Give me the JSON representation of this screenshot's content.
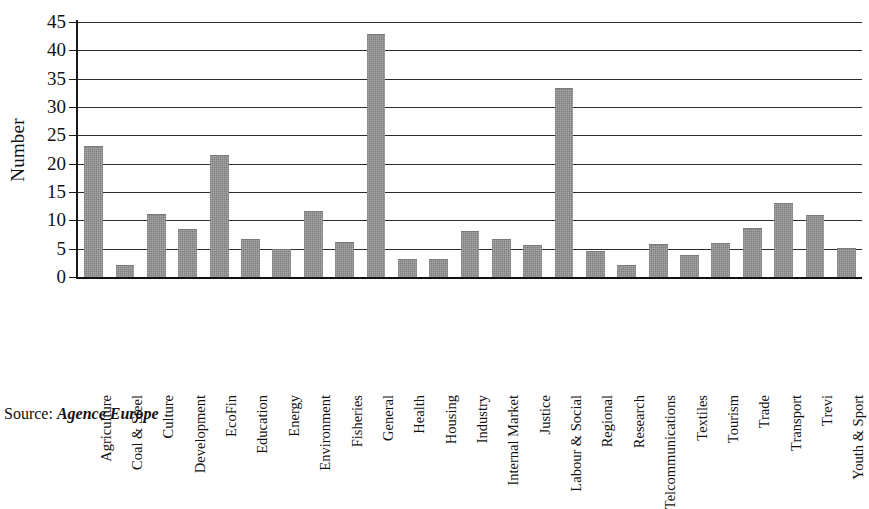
{
  "chart_data": {
    "type": "bar",
    "title": "",
    "xlabel": "",
    "ylabel": "Number",
    "ylim": [
      0,
      45
    ],
    "ytick_step": 5,
    "yticks": [
      45,
      40,
      35,
      30,
      25,
      20,
      15,
      10,
      5,
      0
    ],
    "grid": true,
    "legend": false,
    "bar_color": "#8e8e8e",
    "axis_color": "#1a1a1a",
    "categories": [
      "Agriculture",
      "Coal & Steel",
      "Culture",
      "Development",
      "EcoFin",
      "Education",
      "Energy",
      "Environment",
      "Fisheries",
      "General",
      "Health",
      "Housing",
      "Industry",
      "Internal Market",
      "Justice",
      "Labour & Social",
      "Regional",
      "Research",
      "Telcommunications",
      "Textiles",
      "Tourism",
      "Trade",
      "Transport",
      "Trevi",
      "Youth & Sport"
    ],
    "values": [
      23,
      2,
      11,
      8.3,
      21.3,
      6.5,
      4.8,
      11.5,
      6,
      42.7,
      3,
      3,
      8,
      6.5,
      5.4,
      33.2,
      4.5,
      2,
      5.7,
      3.7,
      5.8,
      8.5,
      12.8,
      10.8,
      5
    ]
  },
  "source": {
    "label": "Source:",
    "value": "Agence Europe"
  }
}
